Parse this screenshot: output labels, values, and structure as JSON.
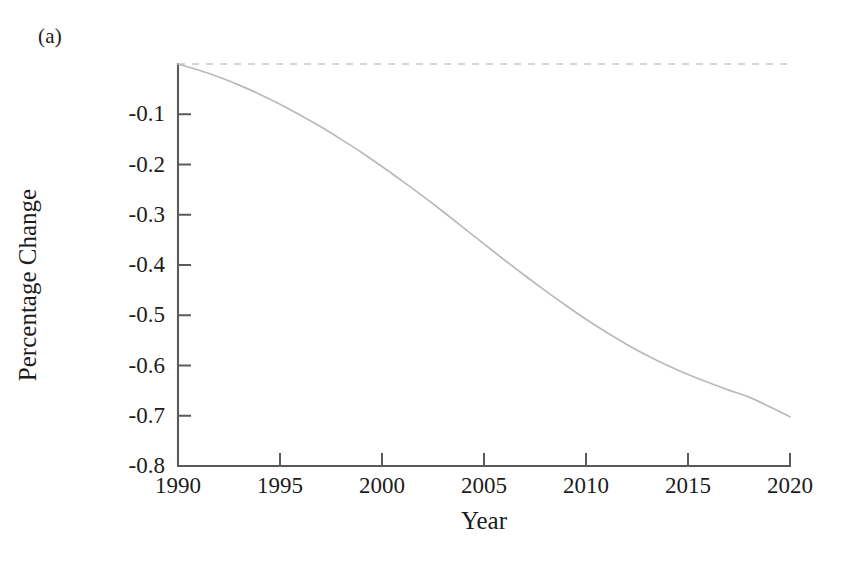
{
  "figure": {
    "panel_label": "(a)"
  },
  "chart_data": {
    "type": "line",
    "title": "",
    "subtitle": "",
    "xlabel": "Year",
    "ylabel": "Percentage Change",
    "xlim": [
      1990,
      2020
    ],
    "ylim": [
      -0.8,
      0.0
    ],
    "grid": false,
    "legend": "none",
    "xticks": [
      1990,
      1995,
      2000,
      2005,
      2010,
      2015,
      2020
    ],
    "xtick_labels": [
      "1990",
      "1995",
      "2000",
      "2005",
      "2010",
      "2015",
      "2020"
    ],
    "yticks": [
      -0.8,
      -0.7,
      -0.6,
      -0.5,
      -0.4,
      -0.3,
      -0.2,
      -0.1
    ],
    "ytick_labels": [
      "-0.8",
      "-0.7",
      "-0.6",
      "-0.5",
      "-0.4",
      "-0.3",
      "-0.2",
      "-0.1"
    ],
    "annotations": [],
    "series": [
      {
        "name": "zero-reference",
        "style": "dashed",
        "color": "#d6d6d6",
        "x": [
          1990,
          2020
        ],
        "values": [
          0.0,
          0.0
        ]
      },
      {
        "name": "percentage-change",
        "style": "solid",
        "color": "#b9b9b9",
        "x": [
          1990,
          1991,
          1992,
          1993,
          1994,
          1995,
          1996,
          1997,
          1998,
          1999,
          2000,
          2001,
          2002,
          2003,
          2004,
          2005,
          2006,
          2007,
          2008,
          2009,
          2010,
          2011,
          2012,
          2013,
          2014,
          2015,
          2016,
          2017,
          2018,
          2019,
          2020
        ],
        "values": [
          0.0,
          -0.012,
          -0.026,
          -0.042,
          -0.06,
          -0.08,
          -0.102,
          -0.125,
          -0.15,
          -0.176,
          -0.204,
          -0.233,
          -0.263,
          -0.294,
          -0.326,
          -0.358,
          -0.39,
          -0.421,
          -0.451,
          -0.48,
          -0.508,
          -0.534,
          -0.558,
          -0.58,
          -0.6,
          -0.618,
          -0.634,
          -0.649,
          -0.663,
          -0.682,
          -0.702
        ]
      }
    ]
  }
}
